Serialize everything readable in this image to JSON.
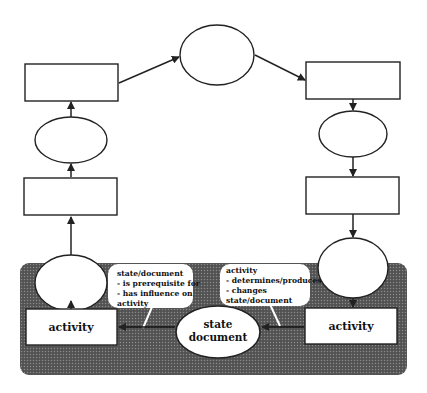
{
  "diagram": {
    "type": "cycle-process",
    "panel": {
      "activity_left_label": "activity",
      "activity_right_label": "activity",
      "state_line1": "state",
      "state_line2": "document",
      "callout_left": [
        "state/document",
        "- is prerequisite for",
        "- has influence on",
        "activity"
      ],
      "callout_right": [
        "activity",
        "- determines/produces",
        "- changes",
        "state/document"
      ]
    },
    "colors": {
      "stroke": "#222222",
      "panel": "#555555",
      "background": "#ffffff"
    }
  }
}
